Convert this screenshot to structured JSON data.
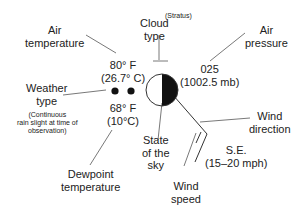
{
  "labels": {
    "air_temperature": [
      "Air",
      "temperature"
    ],
    "cloud_type": [
      "Cloud",
      "type"
    ],
    "cloud_type_note": "(Stratus)",
    "air_pressure": [
      "Air",
      "pressure"
    ],
    "weather_type": [
      "Weather",
      "type"
    ],
    "weather_type_note": [
      "(Continuous",
      "rain slight at time of",
      "observation)"
    ],
    "state_of_sky": [
      "State",
      "of the",
      "sky"
    ],
    "wind_direction": [
      "Wind",
      "direction"
    ],
    "wind_speed": [
      "Wind",
      "speed"
    ],
    "dewpoint_temperature": [
      "Dewpoint",
      "temperature"
    ]
  },
  "values": {
    "air_temperature": [
      "80° F",
      "(26.7° C)"
    ],
    "air_pressure": [
      "025",
      "(1002.5 mb)"
    ],
    "dewpoint": [
      "68° F",
      "(10°C)"
    ],
    "wind": [
      "S.E.",
      "(15–20 mph)"
    ]
  },
  "symbols": {
    "weather": "two-dots-continuous-slight-rain",
    "sky_cover": "half-filled-circle",
    "wind_barb": "two-feathers"
  }
}
